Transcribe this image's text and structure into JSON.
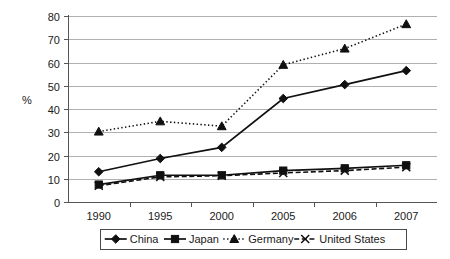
{
  "chart_data": {
    "type": "line",
    "title": "",
    "subtitle": "",
    "xlabel": "",
    "ylabel": "%",
    "categories": [
      "1990",
      "1995",
      "2000",
      "2005",
      "2006",
      "2007"
    ],
    "ylim": [
      0,
      80
    ],
    "yticks": [
      0,
      10,
      20,
      30,
      40,
      50,
      60,
      70,
      80
    ],
    "ytick_labels": [
      "0",
      "10",
      "20",
      "30",
      "40",
      "50",
      "60",
      "70",
      "80"
    ],
    "grid": "horizontal",
    "legend_position": "bottom",
    "series": [
      {
        "name": "China",
        "values": [
          13,
          18.7,
          23.5,
          44.5,
          50.5,
          56.5
        ],
        "marker": "diamond",
        "line_style": "solid",
        "color": "#101010"
      },
      {
        "name": "Japan",
        "values": [
          7.5,
          11.5,
          11.5,
          13.5,
          14.5,
          15.8
        ],
        "marker": "square",
        "line_style": "solid",
        "color": "#101010"
      },
      {
        "name": "Germany",
        "values": [
          30.3,
          34.7,
          32.6,
          59,
          66,
          76.5
        ],
        "marker": "triangle",
        "line_style": "dotted",
        "color": "#101010"
      },
      {
        "name": "United States",
        "values": [
          7,
          10.8,
          11.3,
          12.5,
          13.5,
          15
        ],
        "marker": "x",
        "line_style": "dashed",
        "color": "#101010"
      }
    ]
  },
  "legend": {
    "items": [
      {
        "label": "China"
      },
      {
        "label": "Japan"
      },
      {
        "label": "Germany"
      },
      {
        "label": "United States"
      }
    ]
  }
}
